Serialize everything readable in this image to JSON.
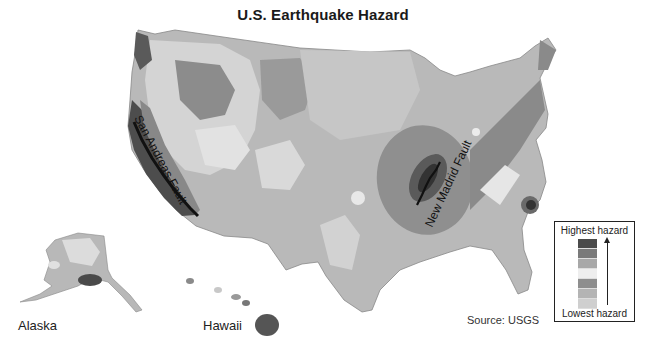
{
  "title": "U.S. Earthquake Hazard",
  "labels": {
    "alaska": "Alaska",
    "hawaii": "Hawaii",
    "san_andreas": "San Andreas Fault",
    "new_madrid": "New Madrid Fault",
    "source": "Source: USGS"
  },
  "legend": {
    "highest": "Highest hazard",
    "lowest": "Lowest hazard",
    "swatches": [
      {
        "level": 7,
        "color": "#4a4a4a"
      },
      {
        "level": 6,
        "color": "#7a7a7a"
      },
      {
        "level": 5,
        "color": "#a8a8a8"
      },
      {
        "level": 4,
        "color": "#eeeeee"
      },
      {
        "level": 3,
        "color": "#8e8e8e"
      },
      {
        "level": 2,
        "color": "#b4b4b4"
      },
      {
        "level": 1,
        "color": "#cfcfcf"
      }
    ]
  },
  "map_colors": {
    "base_land": "#b9b9b9",
    "low": "#cacaca",
    "medium": "#9a9a9a",
    "high": "#6f6f6f",
    "very_high": "#3e3e3e",
    "light_patch": "#e6e6e6",
    "fault_line": "#111111"
  }
}
